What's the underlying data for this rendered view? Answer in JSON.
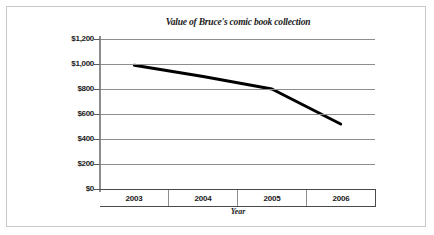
{
  "chart_data": {
    "type": "line",
    "title": "Value of  Bruce's comic book collection",
    "xlabel": "Year",
    "ylabel": "",
    "categories": [
      "2003",
      "2004",
      "2005",
      "2006"
    ],
    "x": [
      2003,
      2004,
      2005,
      2006
    ],
    "values": [
      990,
      900,
      800,
      520
    ],
    "series": [
      {
        "name": "Value of Bruce's comic book collection",
        "values": [
          990,
          900,
          800,
          520
        ]
      }
    ],
    "ylim": [
      0,
      1200
    ],
    "ytick_values": [
      1200,
      1000,
      800,
      600,
      400,
      200,
      0
    ],
    "ytick_labels": [
      "$1,200",
      "$1,000",
      "$800",
      "$600",
      "$400",
      "$200",
      "$0"
    ],
    "grid": true,
    "legend": "none",
    "line_color": "#000000",
    "gridline_color": "#8d8d8d",
    "border_color": "#c9c9c9",
    "background_color": "#ffffff",
    "markers": false
  }
}
